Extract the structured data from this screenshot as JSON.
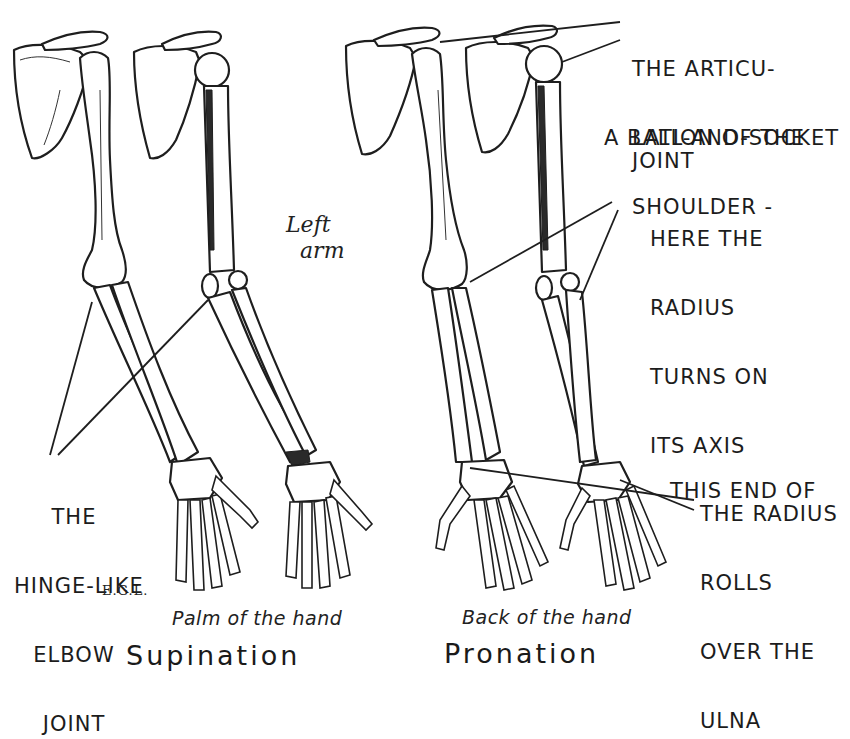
{
  "figure": {
    "title_left": "Supination",
    "title_right": "Pronation",
    "caption_left": "Palm of the hand",
    "caption_right": "Back of the hand",
    "side_note_line1": "Left",
    "side_note_line2": "arm",
    "signature": "E.G.L."
  },
  "annotations": {
    "shoulder": {
      "lines": [
        "THE ARTICU-",
        "LATION OF THE",
        "SHOULDER -",
        "A BALL-AND-SOCKET",
        "JOINT"
      ]
    },
    "radius_axis": {
      "lines": [
        "HERE THE",
        "RADIUS",
        "TURNS ON",
        "ITS AXIS"
      ]
    },
    "radius_end": {
      "lines": [
        "THIS END OF",
        "THE RADIUS",
        "ROLLS",
        "OVER THE",
        "ULNA"
      ]
    },
    "elbow": {
      "lines": [
        "THE",
        "HINGE-LIKE",
        "ELBOW",
        "JOINT"
      ]
    }
  },
  "figures": [
    {
      "id": "supination-front",
      "view": "front",
      "group": "Supination"
    },
    {
      "id": "supination-side",
      "view": "side",
      "group": "Supination"
    },
    {
      "id": "pronation-front",
      "view": "front",
      "group": "Pronation"
    },
    {
      "id": "pronation-side",
      "view": "side",
      "group": "Pronation"
    }
  ],
  "colors": {
    "ink": "#1e1e1e",
    "paper": "#ffffff"
  }
}
